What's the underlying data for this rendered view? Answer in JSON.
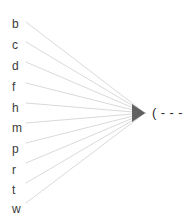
{
  "canvas": {
    "width": 187,
    "height": 220,
    "background_color": "#ffffff"
  },
  "style": {
    "edge_color": "#c9c9c9",
    "edge_width": 0.7,
    "label_color": "#3b3b3b",
    "target_color": "#2e2e2e",
    "converge_point_color": "#4a4a4a"
  },
  "diagram": {
    "type": "fan-convergence",
    "converge_point": {
      "x": 145,
      "y": 113
    },
    "edge_start_x": 26,
    "sources": [
      {
        "label": "b",
        "label_x": 12,
        "label_y": 18,
        "edge_y": 22
      },
      {
        "label": "c",
        "label_x": 12,
        "label_y": 39,
        "edge_y": 42
      },
      {
        "label": "d",
        "label_x": 12,
        "label_y": 60,
        "edge_y": 62
      },
      {
        "label": "f",
        "label_x": 12,
        "label_y": 81,
        "edge_y": 83
      },
      {
        "label": "h",
        "label_x": 12,
        "label_y": 102,
        "edge_y": 103
      },
      {
        "label": "m",
        "label_x": 12,
        "label_y": 122,
        "edge_y": 123
      },
      {
        "label": "p",
        "label_x": 12,
        "label_y": 143,
        "edge_y": 143
      },
      {
        "label": "r",
        "label_x": 12,
        "label_y": 164,
        "edge_y": 163
      },
      {
        "label": "t",
        "label_x": 12,
        "label_y": 184,
        "edge_y": 183
      },
      {
        "label": "w",
        "label_x": 12,
        "label_y": 203,
        "edge_y": 203
      }
    ],
    "target": {
      "text": "( - - - )",
      "x": 152,
      "y": 106
    }
  }
}
